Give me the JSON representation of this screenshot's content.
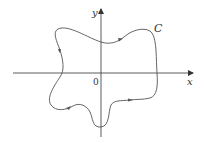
{
  "diagram": {
    "type": "closed-curve-plane",
    "axes": {
      "x_label": "x",
      "y_label": "y",
      "origin_label": "0"
    },
    "curve": {
      "label": "C",
      "orientation": "counterclockwise",
      "color": "#555555"
    },
    "axis_color": "#333333"
  }
}
